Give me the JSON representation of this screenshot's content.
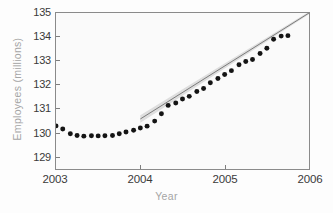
{
  "chart_data": {
    "type": "scatter",
    "title": "",
    "xlabel": "Year",
    "ylabel": "Employees (millions)",
    "xlim": [
      2003.0,
      2006.0
    ],
    "ylim": [
      128.45,
      135.0
    ],
    "xticks": [
      2003,
      2004,
      2005,
      2006
    ],
    "xtick_labels": [
      "2003",
      "2004",
      "2005",
      "2006"
    ],
    "yticks": [
      129,
      130,
      131,
      132,
      133,
      134,
      135
    ],
    "ytick_labels": [
      "129",
      "130",
      "131",
      "132",
      "133",
      "134",
      "135"
    ],
    "grid": false,
    "legend": null,
    "marker_color": "#141414",
    "trendline_color": "#6e6e6e",
    "confidence_band_color": "#d8d8d8",
    "series": [
      {
        "name": "Employees",
        "marker": "filled-circle",
        "x": [
          2003.0,
          2003.08,
          2003.17,
          2003.25,
          2003.33,
          2003.42,
          2003.5,
          2003.58,
          2003.67,
          2003.75,
          2003.83,
          2003.92,
          2004.0,
          2004.08,
          2004.17,
          2004.25,
          2004.33,
          2004.42,
          2004.5,
          2004.58,
          2004.67,
          2004.75,
          2004.83,
          2004.92,
          2005.0,
          2005.08,
          2005.17,
          2005.25,
          2005.33,
          2005.42,
          2005.5,
          2005.58,
          2005.67,
          2005.75
        ],
        "y": [
          130.26,
          130.13,
          129.93,
          129.86,
          129.83,
          129.85,
          129.84,
          129.85,
          129.86,
          129.93,
          130.0,
          130.08,
          130.17,
          130.25,
          130.46,
          130.77,
          131.12,
          131.22,
          131.39,
          131.5,
          131.7,
          131.83,
          132.07,
          132.25,
          132.42,
          132.58,
          132.83,
          132.96,
          133.05,
          133.3,
          133.52,
          133.9,
          134.03,
          134.05
        ]
      }
    ],
    "trendline": {
      "name": "fitted trend",
      "x_start": 2004.0,
      "y_start": 130.55,
      "x_end": 2006.0,
      "y_end": 135.0,
      "band_halfwidth": 0.16
    },
    "annotations": []
  }
}
